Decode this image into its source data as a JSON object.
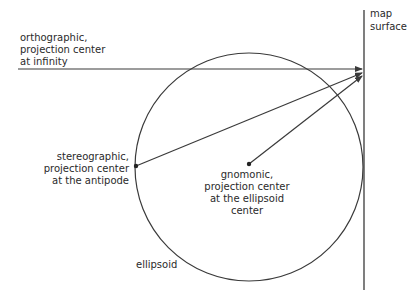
{
  "diagram": {
    "labels": {
      "orthographic": [
        "orthographic,",
        "projection center",
        "at infinity"
      ],
      "stereographic": [
        "stereographic,",
        "projection center",
        "at the antipode"
      ],
      "gnomonic": [
        "gnomonic,",
        "projection center",
        "at the ellipsoid",
        "center"
      ],
      "map_surface": [
        "map",
        "surface"
      ],
      "ellipsoid": "ellipsoid"
    },
    "colors": {
      "stroke": "#3a3a3a",
      "text": "#2a2a2a",
      "background": "#ffffff"
    }
  }
}
